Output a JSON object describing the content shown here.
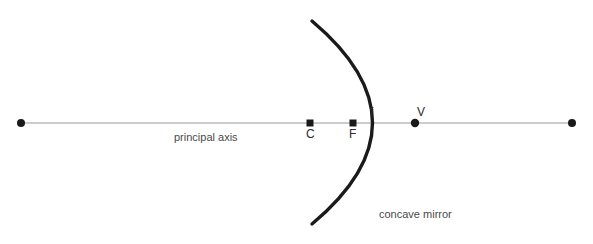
{
  "diagram": {
    "background_color": "#ffffff",
    "axis": {
      "label": "principal axis",
      "color": "#9a9a9a",
      "y": 123,
      "x_start": 21,
      "x_end": 572,
      "endpoint_color": "#1a1a1a"
    },
    "mirror": {
      "label": "concave mirror",
      "color": "#1a1a1a",
      "stroke_width": 3.2,
      "vertex_x": 415,
      "top_end": {
        "x": 312,
        "y": 21
      },
      "bottom_end": {
        "x": 312,
        "y": 224
      }
    },
    "points": [
      {
        "name": "center-of-curvature",
        "label": "C",
        "x": 310,
        "y": 123,
        "marker": "square"
      },
      {
        "name": "focal-point",
        "label": "F",
        "x": 353,
        "y": 123,
        "marker": "square"
      },
      {
        "name": "vertex",
        "label": "V",
        "x": 415,
        "y": 123,
        "marker": "circle"
      }
    ],
    "focal_length": {
      "label": "f",
      "from": "F",
      "to": "V"
    },
    "marker_color": "#1a1a1a"
  }
}
